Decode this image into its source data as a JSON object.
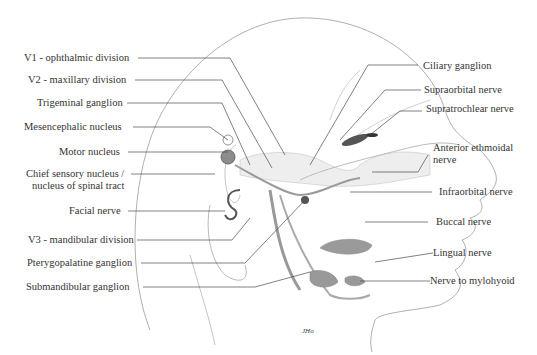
{
  "labels_left": [
    {
      "id": "v1",
      "text": "V1 - ophthalmic division"
    },
    {
      "id": "v2",
      "text": "V2 - maxillary division"
    },
    {
      "id": "trigeminal-ganglion",
      "text": "Trigeminal ganglion"
    },
    {
      "id": "mesencephalic",
      "text": "Mesencephalic nucleus"
    },
    {
      "id": "motor",
      "text": "Motor nucleus"
    },
    {
      "id": "chief-sensory",
      "text": "Chief sensory nucleus /",
      "text2": "nucleus of spinal tract"
    },
    {
      "id": "facial",
      "text": "Facial nerve"
    },
    {
      "id": "v3",
      "text": "V3 - mandibular division"
    },
    {
      "id": "pterygopalatine",
      "text": "Pterygopalatine ganglion"
    },
    {
      "id": "submandibular",
      "text": "Submandibular ganglion"
    }
  ],
  "labels_right": [
    {
      "id": "ciliary",
      "text": "Ciliary ganglion"
    },
    {
      "id": "supraorbital",
      "text": "Supraorbital nerve"
    },
    {
      "id": "supratrochlear",
      "text": "Supratrochlear nerve"
    },
    {
      "id": "anterior-ethmoidal",
      "text": "Anterior ethmoidal",
      "text2": "nerve"
    },
    {
      "id": "infraorbital",
      "text": "Infraorbital nerve"
    },
    {
      "id": "buccal",
      "text": "Buccal nerve"
    },
    {
      "id": "lingual",
      "text": "Lingual nerve"
    },
    {
      "id": "mylohyoid",
      "text": "Nerve to mylohyoid"
    }
  ],
  "signature": "JHo",
  "colors": {
    "line": "#4a4a4a",
    "head": "#9a9a9a",
    "gray_fill": "#8c8c8c",
    "nerve": "#7a7a7a"
  }
}
